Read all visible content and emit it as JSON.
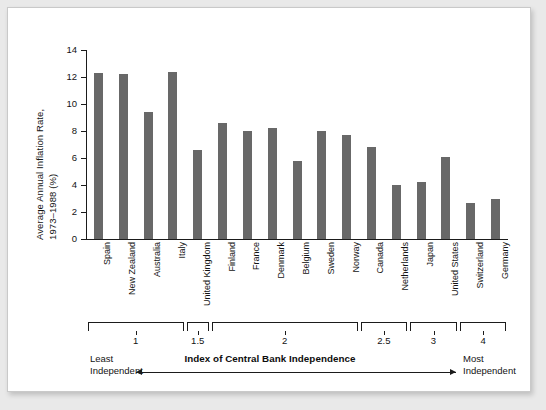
{
  "chart_data": {
    "type": "bar",
    "title": "",
    "xlabel": "Index of Central Bank Independence",
    "ylabel_line1": "Average Annual Inflation Rate,",
    "ylabel_line2": "1973–1988 (%)",
    "ylim": [
      0,
      14
    ],
    "yticks": [
      0,
      2,
      4,
      6,
      8,
      10,
      12,
      14
    ],
    "grid": false,
    "legend": null,
    "categories": [
      "Spain",
      "New Zealand",
      "Australia",
      "Italy",
      "United Kingdom",
      "Finland",
      "France",
      "Denmark",
      "Belgium",
      "Sweden",
      "Norway",
      "Canada",
      "Netherlands",
      "Japan",
      "United States",
      "Switzerland",
      "Germany"
    ],
    "values": [
      12.3,
      12.2,
      9.4,
      12.4,
      6.6,
      8.6,
      8.0,
      8.2,
      5.8,
      8.0,
      7.7,
      6.8,
      4.0,
      4.2,
      6.1,
      2.7,
      3.0
    ],
    "bar_color": "#686868",
    "axis_color": "#1b1b1b",
    "index_brackets": [
      {
        "label": "1",
        "start_index": 0,
        "end_index": 3
      },
      {
        "label": "1.5",
        "start_index": 4,
        "end_index": 4
      },
      {
        "label": "2",
        "start_index": 5,
        "end_index": 10
      },
      {
        "label": "2.5",
        "start_index": 11,
        "end_index": 12
      },
      {
        "label": "3",
        "start_index": 13,
        "end_index": 14
      },
      {
        "label": "4",
        "start_index": 15,
        "end_index": 16
      }
    ],
    "annotations": {
      "left_end_line1": "Least",
      "left_end_line2": "Independent",
      "right_end_line1": "Most",
      "right_end_line2": "Independent"
    }
  }
}
